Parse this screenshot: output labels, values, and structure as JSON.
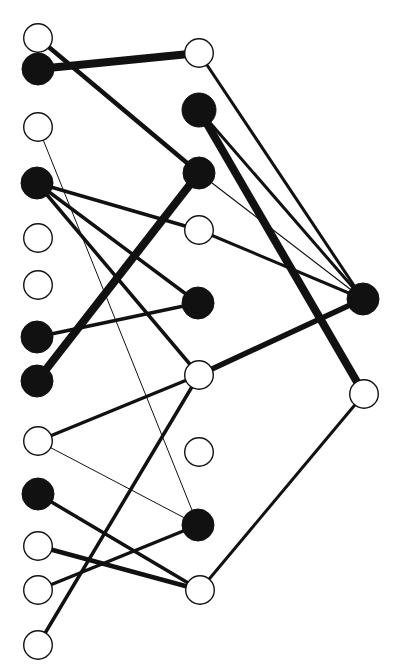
{
  "figure": {
    "width": 396,
    "height": 672,
    "background": "#ffffff",
    "node_stroke": "#111111",
    "node_fill_dark": "#111111",
    "node_fill_light": "#ffffff",
    "edge_color": "#111111"
  },
  "chart_data": {
    "type": "diagram",
    "title": "",
    "layout": "layered node-link graph, three columns, left to right",
    "legend": [
      {
        "key": "filled",
        "label": "filled node",
        "color": "#111111"
      },
      {
        "key": "open",
        "label": "open node",
        "color": "#ffffff"
      }
    ],
    "columns": [
      {
        "name": "left",
        "x": 38,
        "count": 13
      },
      {
        "name": "middle",
        "x": 199,
        "count": 9
      },
      {
        "name": "right",
        "x": 363,
        "count": 2
      }
    ],
    "nodes": [
      {
        "id": "L1",
        "column": "left",
        "x": 38,
        "y": 38,
        "r": 15,
        "fill": "open"
      },
      {
        "id": "L2",
        "column": "left",
        "x": 38,
        "y": 69,
        "r": 16,
        "fill": "filled"
      },
      {
        "id": "L3",
        "column": "left",
        "x": 38,
        "y": 127,
        "r": 15,
        "fill": "open"
      },
      {
        "id": "L4",
        "column": "left",
        "x": 37,
        "y": 183,
        "r": 16,
        "fill": "filled"
      },
      {
        "id": "L5",
        "column": "left",
        "x": 38,
        "y": 238,
        "r": 15,
        "fill": "open"
      },
      {
        "id": "L6",
        "column": "left",
        "x": 38,
        "y": 285,
        "r": 15,
        "fill": "open"
      },
      {
        "id": "L7",
        "column": "left",
        "x": 37,
        "y": 337,
        "r": 16,
        "fill": "filled"
      },
      {
        "id": "L8",
        "column": "left",
        "x": 37,
        "y": 381,
        "r": 16,
        "fill": "filled"
      },
      {
        "id": "L9",
        "column": "left",
        "x": 38,
        "y": 441,
        "r": 15,
        "fill": "open"
      },
      {
        "id": "L10",
        "column": "left",
        "x": 38,
        "y": 494,
        "r": 16,
        "fill": "filled"
      },
      {
        "id": "L11",
        "column": "left",
        "x": 38,
        "y": 546,
        "r": 15,
        "fill": "open"
      },
      {
        "id": "L12",
        "column": "left",
        "x": 38,
        "y": 590,
        "r": 15,
        "fill": "open"
      },
      {
        "id": "L13",
        "column": "left",
        "x": 38,
        "y": 645,
        "r": 15,
        "fill": "open"
      },
      {
        "id": "M1",
        "column": "middle",
        "x": 199,
        "y": 53,
        "r": 15,
        "fill": "open"
      },
      {
        "id": "M2",
        "column": "middle",
        "x": 199,
        "y": 110,
        "r": 17,
        "fill": "filled"
      },
      {
        "id": "M3",
        "column": "middle",
        "x": 199,
        "y": 173,
        "r": 16,
        "fill": "filled"
      },
      {
        "id": "M4",
        "column": "middle",
        "x": 199,
        "y": 230,
        "r": 15,
        "fill": "open"
      },
      {
        "id": "M5",
        "column": "middle",
        "x": 198,
        "y": 303,
        "r": 16,
        "fill": "filled"
      },
      {
        "id": "M6",
        "column": "middle",
        "x": 199,
        "y": 375,
        "r": 15,
        "fill": "open"
      },
      {
        "id": "M7",
        "column": "middle",
        "x": 199,
        "y": 452,
        "r": 15,
        "fill": "open"
      },
      {
        "id": "M8",
        "column": "middle",
        "x": 198,
        "y": 525,
        "r": 16,
        "fill": "filled"
      },
      {
        "id": "M9",
        "column": "middle",
        "x": 200,
        "y": 590,
        "r": 15,
        "fill": "open"
      },
      {
        "id": "R1",
        "column": "right",
        "x": 363,
        "y": 299,
        "r": 16,
        "fill": "filled"
      },
      {
        "id": "R2",
        "column": "right",
        "x": 364,
        "y": 394,
        "r": 15,
        "fill": "open"
      }
    ],
    "edges": [
      {
        "source": "L1",
        "target": "M3",
        "weight": 4.5
      },
      {
        "source": "L2",
        "target": "M1",
        "weight": 8.0
      },
      {
        "source": "L3",
        "target": "M8",
        "weight": 1.0
      },
      {
        "source": "L4",
        "target": "M4",
        "weight": 3.5
      },
      {
        "source": "L4",
        "target": "M5",
        "weight": 3.5
      },
      {
        "source": "L4",
        "target": "M6",
        "weight": 3.5
      },
      {
        "source": "L7",
        "target": "M5",
        "weight": 3.5
      },
      {
        "source": "L8",
        "target": "M3",
        "weight": 8.0
      },
      {
        "source": "L9",
        "target": "M6",
        "weight": 3.5
      },
      {
        "source": "L9",
        "target": "M8",
        "weight": 1.0
      },
      {
        "source": "L10",
        "target": "M9",
        "weight": 3.5
      },
      {
        "source": "L11",
        "target": "M9",
        "weight": 4.5
      },
      {
        "source": "L12",
        "target": "M8",
        "weight": 3.5
      },
      {
        "source": "L13",
        "target": "M6",
        "weight": 3.5
      },
      {
        "source": "M1",
        "target": "R1",
        "weight": 3.0
      },
      {
        "source": "M2",
        "target": "R1",
        "weight": 3.0
      },
      {
        "source": "M2",
        "target": "R2",
        "weight": 8.0
      },
      {
        "source": "M3",
        "target": "R1",
        "weight": 1.2
      },
      {
        "source": "M4",
        "target": "R1",
        "weight": 3.0
      },
      {
        "source": "M6",
        "target": "R1",
        "weight": 5.5
      },
      {
        "source": "M9",
        "target": "R2",
        "weight": 3.0
      }
    ]
  }
}
